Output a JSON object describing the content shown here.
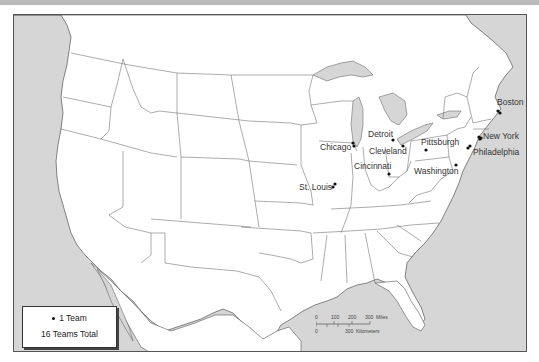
{
  "map": {
    "title": "",
    "ocean_color": "#d6d6d6",
    "land_color": "#ffffff",
    "border_color": "#555555"
  },
  "cities": [
    {
      "name": "Boston",
      "teams": 1
    },
    {
      "name": "New York",
      "teams": 1
    },
    {
      "name": "Philadelphia",
      "teams": 1
    },
    {
      "name": "Pittsburgh",
      "teams": 1
    },
    {
      "name": "Washington",
      "teams": 1
    },
    {
      "name": "Detroit",
      "teams": 1
    },
    {
      "name": "Cleveland",
      "teams": 1
    },
    {
      "name": "Chicago",
      "teams": 1
    },
    {
      "name": "Cincinnati",
      "teams": 1
    },
    {
      "name": "St. Louis",
      "teams": 1
    }
  ],
  "legend": {
    "symbol_label": "1 Team",
    "total_label": "16 Teams Total"
  },
  "scale_bar": {
    "miles_ticks": [
      "0",
      "100",
      "200",
      "300"
    ],
    "miles_unit": "Miles",
    "km_ticks": [
      "0",
      "300"
    ],
    "km_unit": "Kilometers"
  }
}
